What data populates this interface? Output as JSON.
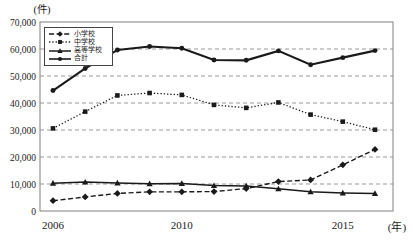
{
  "chart_data": {
    "type": "line",
    "title": "",
    "y_axis_unit_label": "(件)",
    "x_axis_unit_label": "(年)",
    "x": [
      2006,
      2007,
      2008,
      2009,
      2010,
      2011,
      2012,
      2013,
      2014,
      2015,
      2016
    ],
    "x_ticks": [
      {
        "year": 2006,
        "label": "2006"
      },
      {
        "year": 2010,
        "label": "2010"
      },
      {
        "year": 2015,
        "label": "2015"
      }
    ],
    "ylim": [
      0,
      70000
    ],
    "y_tick_interval": 10000,
    "y_tick_labels": [
      "0",
      "10,000",
      "20,000",
      "30,000",
      "40,000",
      "50,000",
      "60,000",
      "70,000"
    ],
    "grid": "horizontal-dashed",
    "legend_position": "top-left-inside",
    "line_color": "#1a1a1a",
    "grid_color": "#999999",
    "border_color": "#808080",
    "series": [
      {
        "name": "小学校",
        "line_style": "dashed",
        "marker": "diamond",
        "thickness": 1.4,
        "values": [
          3800,
          5200,
          6500,
          7100,
          7100,
          7200,
          8300,
          10900,
          11500,
          17100,
          22800
        ]
      },
      {
        "name": "中学校",
        "line_style": "dotted",
        "marker": "square",
        "thickness": 1.3,
        "values": [
          30600,
          36800,
          42800,
          43700,
          43000,
          39300,
          38200,
          40200,
          35700,
          33100,
          30100
        ]
      },
      {
        "name": "高等学校",
        "line_style": "solid",
        "marker": "triangle",
        "thickness": 1.5,
        "values": [
          10300,
          10700,
          10400,
          10100,
          10200,
          9400,
          9300,
          8200,
          7100,
          6700,
          6500
        ]
      },
      {
        "name": "合計",
        "line_style": "solid",
        "marker": "circle",
        "thickness": 2.1,
        "values": [
          44600,
          52800,
          59600,
          60900,
          60300,
          55900,
          55800,
          59300,
          54200,
          56800,
          59400
        ]
      }
    ]
  }
}
